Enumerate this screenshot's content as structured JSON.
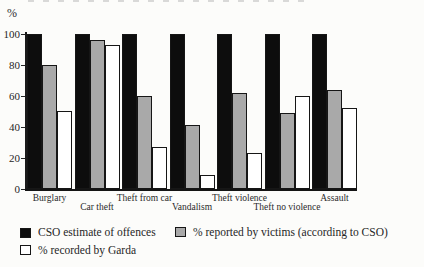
{
  "figure": {
    "background": "#fcfcfa",
    "ink_color": "#1a1a1a"
  },
  "chart_data": {
    "type": "bar",
    "title": "",
    "ylabel": "%",
    "xlabel": "",
    "ylim": [
      0,
      100
    ],
    "yticks": [
      0,
      20,
      40,
      60,
      80,
      100
    ],
    "grid": false,
    "legend_position": "bottom",
    "categories": [
      "Burglary",
      "Car theft",
      "Theft from car",
      "Vandalism",
      "Theft violence",
      "Theft no violence",
      "Assault"
    ],
    "series": [
      {
        "name": "CSO estimate of offences",
        "color": "#0d0d0d",
        "values": [
          100,
          100,
          100,
          100,
          100,
          100,
          100
        ]
      },
      {
        "name": "% reported by victims (according to CSO)",
        "color": "#a9a9a9",
        "values": [
          80,
          96,
          60,
          41,
          62,
          49,
          64
        ]
      },
      {
        "name": "% recorded by Garda",
        "color": "#ffffff",
        "values": [
          50,
          93,
          27,
          9,
          23,
          60,
          52
        ]
      }
    ]
  }
}
